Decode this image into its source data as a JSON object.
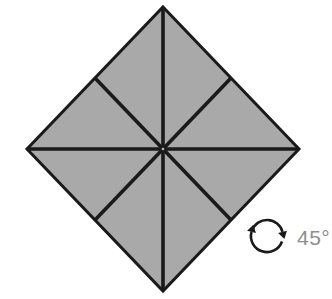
{
  "diagram": {
    "shape": {
      "name": "square rotated 45 degrees (diamond) divided into 8 congruent triangles",
      "sections": 8,
      "fill_color": "#a9a9a9",
      "line_color": "#1a1a1a"
    },
    "rotation": {
      "label": "45°",
      "direction": "clockwise",
      "label_color": "#8e8e8e"
    },
    "background_color": "#ffffff"
  }
}
